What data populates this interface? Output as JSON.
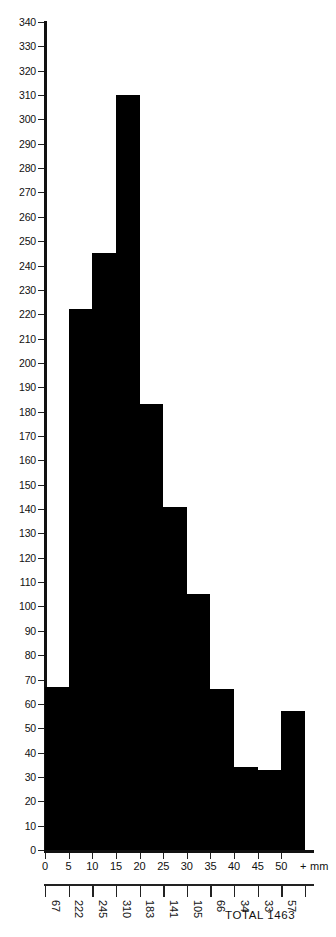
{
  "chart_data": {
    "type": "bar",
    "title": "",
    "subtitle": "",
    "xlabel": "+ mm",
    "ylabel": "",
    "grid": false,
    "legend": null,
    "xlim": [
      0,
      55
    ],
    "ylim": [
      0,
      340
    ],
    "x_tick_labels": [
      "0",
      "5",
      "10",
      "15",
      "20",
      "25",
      "30",
      "35",
      "40",
      "45",
      "50"
    ],
    "x_tick_values": [
      0,
      5,
      10,
      15,
      20,
      25,
      30,
      35,
      40,
      45,
      50
    ],
    "y_tick_labels": [
      "0",
      "10",
      "20",
      "30",
      "40",
      "50",
      "60",
      "70",
      "80",
      "90",
      "100",
      "110",
      "120",
      "130",
      "140",
      "150",
      "160",
      "170",
      "180",
      "190",
      "200",
      "210",
      "220",
      "230",
      "240",
      "250",
      "260",
      "270",
      "280",
      "290",
      "300",
      "310",
      "320",
      "330",
      "340"
    ],
    "y_tick_values": [
      0,
      10,
      20,
      30,
      40,
      50,
      60,
      70,
      80,
      90,
      100,
      110,
      120,
      130,
      140,
      150,
      160,
      170,
      180,
      190,
      200,
      210,
      220,
      230,
      240,
      250,
      260,
      270,
      280,
      290,
      300,
      310,
      320,
      330,
      340
    ],
    "bin_width": 5,
    "bin_edges": [
      0,
      5,
      10,
      15,
      20,
      25,
      30,
      35,
      40,
      45,
      50,
      55
    ],
    "categories": [
      "0-5",
      "5-10",
      "10-15",
      "15-20",
      "20-25",
      "25-30",
      "30-35",
      "35-40",
      "40-45",
      "45-50",
      "50-55"
    ],
    "values": [
      67,
      222,
      245,
      310,
      183,
      141,
      105,
      66,
      34,
      33,
      57
    ],
    "bin_count_labels": [
      "67",
      "222",
      "245",
      "310",
      "183",
      "141",
      "105",
      "66",
      "34",
      "33",
      "57"
    ],
    "bar_color": "#000000",
    "axis_color": "#111111",
    "annotations": [
      {
        "name": "total",
        "text": "TOTAL  1463",
        "value": 1463
      }
    ]
  },
  "axis": {
    "x_unit_label": "+ mm"
  },
  "footer": {
    "total_label": "TOTAL  1463"
  }
}
